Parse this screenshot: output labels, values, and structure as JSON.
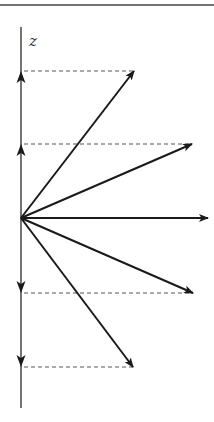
{
  "figure": {
    "axis_label": "z",
    "colors": {
      "ink": "#1a1a1a",
      "axis": "#3a3a3a",
      "dashed": "#555555",
      "background": "#ffffff"
    },
    "top_rule": {
      "x1": 0,
      "x2": 214,
      "y": 5
    },
    "axis": {
      "x": 21,
      "y_top": 27,
      "y_bottom": 408
    },
    "origin": {
      "x": 21,
      "y": 218
    },
    "label_pos": {
      "x": 29,
      "y": 46
    },
    "vectors": [
      {
        "name": "vector-up-steep",
        "tip_x": 134,
        "tip_y": 71
      },
      {
        "name": "vector-up-shallow",
        "tip_x": 192,
        "tip_y": 144
      },
      {
        "name": "vector-horizontal",
        "tip_x": 208,
        "tip_y": 218
      },
      {
        "name": "vector-down-shallow",
        "tip_x": 193,
        "tip_y": 293
      },
      {
        "name": "vector-down-steep",
        "tip_x": 133,
        "tip_y": 367
      }
    ],
    "projections": [
      {
        "name": "projection-1",
        "y": 71,
        "x_end": 134,
        "direction": "up"
      },
      {
        "name": "projection-2",
        "y": 144,
        "x_end": 192,
        "direction": "up"
      },
      {
        "name": "projection-3",
        "y": 293,
        "x_end": 193,
        "direction": "down"
      },
      {
        "name": "projection-4",
        "y": 367,
        "x_end": 133,
        "direction": "down"
      }
    ]
  }
}
